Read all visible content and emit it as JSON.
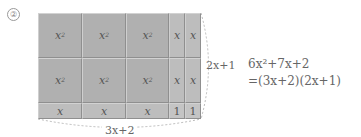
{
  "marker": "②",
  "tiles": {
    "square_label": "x",
    "square_exp": "2",
    "strip_label": "x",
    "unit_label": "1"
  },
  "labels": {
    "height": "2x+1",
    "width": "3x+2"
  },
  "equation": {
    "line1": "6x²+7x+2",
    "line2": "=(3x+2)(2x+1)"
  },
  "colors": {
    "tile_square": "#b0b0b0",
    "tile_strip": "#bdbdbd",
    "tile_unit": "#c4c4c4",
    "grid_line": "#777777",
    "dash": "#aaaaaa"
  }
}
